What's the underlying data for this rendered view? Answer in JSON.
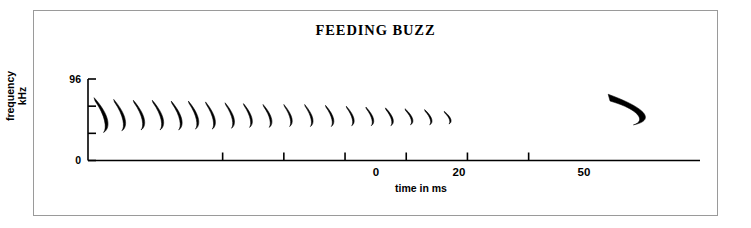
{
  "figure": {
    "title": "FEEDING BUZZ",
    "border_color": "#9a9a9a",
    "trace_color": "#000000",
    "axis_color": "#000000"
  },
  "chart_data": {
    "type": "line",
    "title": "FEEDING BUZZ",
    "subtitle": "",
    "xlabel": "time in ms",
    "ylabel": "frequency kHz",
    "ylabel_lines": [
      "frequency",
      "kHz"
    ],
    "grid": false,
    "legend": "none",
    "xlim": [
      -22,
      78
    ],
    "ylim": [
      0,
      96
    ],
    "y_ticks": [
      0,
      32,
      64,
      96
    ],
    "y_tick_labels": [
      "0",
      "",
      "",
      "96"
    ],
    "y_tick_labels_shown": [
      "0",
      "96"
    ],
    "x_ticks": [
      0,
      10,
      20,
      30,
      40,
      50
    ],
    "x_tick_labels": [
      "0",
      "",
      "20",
      "",
      "",
      "50"
    ],
    "x_tick_labels_shown": [
      "0",
      "20",
      "50"
    ],
    "series": [
      {
        "name": "buzz calls",
        "note": "Each call is a short downward frequency sweep drawn as a crescent trace. t_ms = call onset time, f_hi = sweep start frequency kHz, f_lo = sweep end frequency kHz.",
        "calls": [
          {
            "t_ms": -21.0,
            "f_hi": 74,
            "f_lo": 33,
            "width_ms": 2.8,
            "thickness": 3.6
          },
          {
            "t_ms": -17.8,
            "f_hi": 72,
            "f_lo": 35,
            "width_ms": 2.4,
            "thickness": 2.8
          },
          {
            "t_ms": -14.6,
            "f_hi": 71,
            "f_lo": 36,
            "width_ms": 2.3,
            "thickness": 2.6
          },
          {
            "t_ms": -11.5,
            "f_hi": 71,
            "f_lo": 36,
            "width_ms": 2.3,
            "thickness": 2.6
          },
          {
            "t_ms": -8.4,
            "f_hi": 70,
            "f_lo": 36,
            "width_ms": 2.2,
            "thickness": 2.5
          },
          {
            "t_ms": -5.6,
            "f_hi": 70,
            "f_lo": 37,
            "width_ms": 2.1,
            "thickness": 2.5
          },
          {
            "t_ms": -2.8,
            "f_hi": 69,
            "f_lo": 37,
            "width_ms": 2.0,
            "thickness": 2.4
          },
          {
            "t_ms": 0.4,
            "f_hi": 68,
            "f_lo": 38,
            "width_ms": 1.9,
            "thickness": 2.3
          },
          {
            "t_ms": 3.4,
            "f_hi": 67,
            "f_lo": 39,
            "width_ms": 1.8,
            "thickness": 2.2
          },
          {
            "t_ms": 6.6,
            "f_hi": 66,
            "f_lo": 39,
            "width_ms": 1.8,
            "thickness": 2.2
          },
          {
            "t_ms": 10.0,
            "f_hi": 66,
            "f_lo": 40,
            "width_ms": 1.7,
            "thickness": 2.1
          },
          {
            "t_ms": 13.4,
            "f_hi": 66,
            "f_lo": 40,
            "width_ms": 1.7,
            "thickness": 2.1
          },
          {
            "t_ms": 16.8,
            "f_hi": 65,
            "f_lo": 40,
            "width_ms": 1.7,
            "thickness": 2.1
          },
          {
            "t_ms": 20.2,
            "f_hi": 64,
            "f_lo": 41,
            "width_ms": 1.6,
            "thickness": 2.0
          },
          {
            "t_ms": 23.4,
            "f_hi": 63,
            "f_lo": 41,
            "width_ms": 1.6,
            "thickness": 2.0
          },
          {
            "t_ms": 26.6,
            "f_hi": 62,
            "f_lo": 41,
            "width_ms": 1.6,
            "thickness": 2.0
          },
          {
            "t_ms": 29.8,
            "f_hi": 61,
            "f_lo": 42,
            "width_ms": 1.6,
            "thickness": 1.9
          },
          {
            "t_ms": 33.0,
            "f_hi": 60,
            "f_lo": 42,
            "width_ms": 1.5,
            "thickness": 1.8
          },
          {
            "t_ms": 36.2,
            "f_hi": 58,
            "f_lo": 43,
            "width_ms": 1.4,
            "thickness": 1.7
          }
        ]
      },
      {
        "name": "search-phase call",
        "note": "Single isolated long call, thicker and broader than the buzz calls.",
        "calls": [
          {
            "t_ms": 63.0,
            "f_hi": 78,
            "f_lo": 42,
            "width_ms": 7.5,
            "thickness": 7.5
          }
        ]
      }
    ]
  }
}
